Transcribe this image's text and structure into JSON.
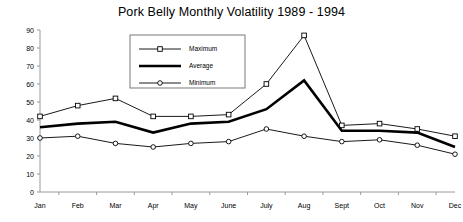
{
  "chart_data": {
    "type": "line",
    "title": "Pork Belly Monthly Volatility 1989 - 1994",
    "xlabel": "",
    "ylabel": "",
    "categories": [
      "Jan",
      "Feb",
      "Mar",
      "Apr",
      "May",
      "June",
      "July",
      "Aug",
      "Sept",
      "Oct",
      "Nov",
      "Dec"
    ],
    "series": [
      {
        "name": "Maximum",
        "values": [
          42,
          48,
          52,
          42,
          42,
          43,
          60,
          87,
          37,
          38,
          35,
          31
        ],
        "marker": "open-square",
        "line_width": "thin"
      },
      {
        "name": "Average",
        "values": [
          36,
          38,
          39,
          33,
          38,
          39,
          46,
          62,
          34,
          34,
          33,
          25
        ],
        "marker": "none",
        "line_width": "thick"
      },
      {
        "name": "Minimum",
        "values": [
          30,
          31,
          27,
          25,
          27,
          28,
          35,
          31,
          28,
          29,
          26,
          21
        ],
        "marker": "open-circle",
        "line_width": "thin"
      }
    ],
    "ylim": [
      0,
      90
    ],
    "yticks": [
      0,
      10,
      20,
      30,
      40,
      50,
      60,
      70,
      80,
      90
    ],
    "grid": false,
    "legend_position": "upper-center-left",
    "line_color": "#000000",
    "axis_color": "#808080"
  },
  "legend": {
    "entries": [
      {
        "label": "Maximum"
      },
      {
        "label": "Average"
      },
      {
        "label": "Minimum"
      }
    ]
  }
}
